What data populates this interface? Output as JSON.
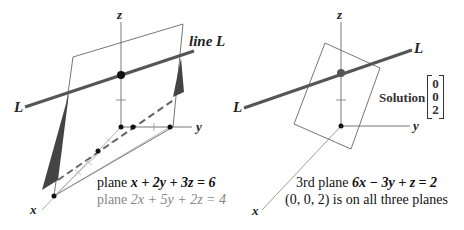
{
  "left_diagram": {
    "axes": {
      "z": "z",
      "y": "y",
      "x": "x"
    },
    "line_labels": {
      "left_end": "L",
      "right_end": "line L"
    },
    "plane1": {
      "prefix": "plane ",
      "equation": "x + 2y + 3z = 6"
    },
    "plane2": {
      "prefix": "plane ",
      "equation": "2x + 5y + 2z = 4"
    }
  },
  "right_diagram": {
    "axes": {
      "z": "z",
      "y": "y",
      "x": "x"
    },
    "line_labels": {
      "left_end": "L",
      "right_end": "L"
    },
    "solution": {
      "label": "Solution",
      "vector": [
        "0",
        "0",
        "2"
      ]
    },
    "plane3": {
      "prefix": "3rd plane ",
      "equation": "6x − 3y + z = 2"
    },
    "note": "(0, 0, 2) is on all three planes"
  },
  "colors": {
    "line_L": "#555555",
    "plane_outline": "#666666",
    "triangle_fill": "#444444",
    "axis": "#777777",
    "dashed_intersection": "#666666",
    "secondary_text": "#888888"
  }
}
